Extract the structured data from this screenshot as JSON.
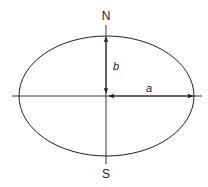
{
  "diagram": {
    "labels": {
      "north": "N",
      "south": "S",
      "semi_minor": "b",
      "semi_major": "a"
    },
    "colors": {
      "stroke": "#222222",
      "background": "#ffffff"
    },
    "geometry": {
      "center": [
        106,
        96
      ],
      "semi_major_px": 87,
      "semi_minor_px": 60
    }
  }
}
